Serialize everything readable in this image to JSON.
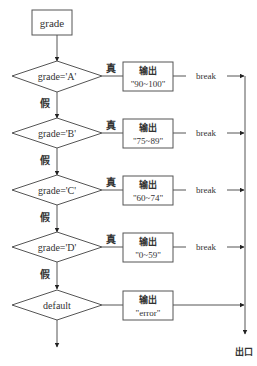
{
  "diagram": {
    "type": "flowchart",
    "start_box": {
      "label": "grade"
    },
    "decisions": [
      {
        "condition": "grade='A'",
        "true_label": "真",
        "false_label": "假",
        "output_title": "输出",
        "output_value": "\"90~100\"",
        "after": "break"
      },
      {
        "condition": "grade='B'",
        "true_label": "真",
        "false_label": "假",
        "output_title": "输出",
        "output_value": "\"75~89\"",
        "after": "break"
      },
      {
        "condition": "grade='C'",
        "true_label": "真",
        "false_label": "假",
        "output_title": "输出",
        "output_value": "\"60~74\"",
        "after": "break"
      },
      {
        "condition": "grade='D'",
        "true_label": "真",
        "false_label": "假",
        "output_title": "输出",
        "output_value": "\"0~59\"",
        "after": "break"
      }
    ],
    "default_case": {
      "label": "default",
      "output_title": "输出",
      "output_value": "\"error\""
    },
    "exit_label": "出口",
    "colors": {
      "stroke": "#555555",
      "text": "#333333",
      "background": "#ffffff"
    }
  }
}
